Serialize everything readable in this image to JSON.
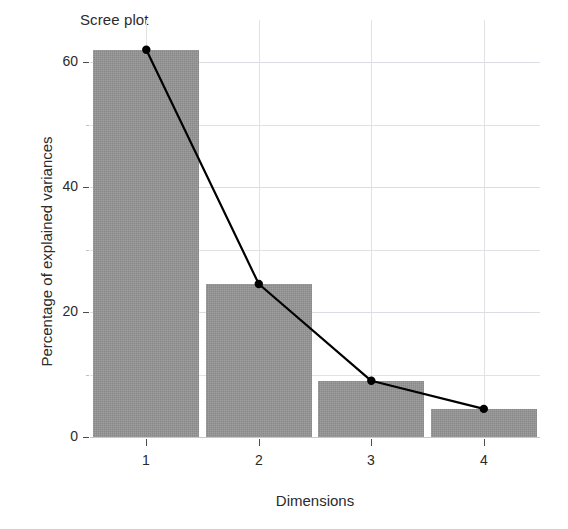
{
  "chart_data": {
    "type": "bar",
    "title": "Scree plot",
    "xlabel": "Dimensions",
    "ylabel": "Percentage of explained variances",
    "categories": [
      "1",
      "2",
      "3",
      "4"
    ],
    "values": [
      62.0,
      24.5,
      9.0,
      4.5
    ],
    "series": [
      {
        "name": "Percentage of explained variances",
        "type": "bar",
        "values": [
          62.0,
          24.5,
          9.0,
          4.5
        ]
      },
      {
        "name": "Cumulative trend line",
        "type": "line",
        "values": [
          62.0,
          24.5,
          9.0,
          4.5
        ],
        "marker": "filled-circle",
        "color": "#000000"
      }
    ],
    "ylim": [
      0,
      65
    ],
    "y_ticks": [
      0,
      20,
      40,
      60
    ],
    "y_tick_labels": [
      "0",
      "20",
      "40",
      "60"
    ],
    "y_minor_ticks": [
      10,
      30,
      50
    ],
    "x_ticks": [
      "1",
      "2",
      "3",
      "4"
    ],
    "grid": true,
    "legend": "none",
    "bar_color": "#969696",
    "line_color": "#000000",
    "grid_color": "#e2e2e6",
    "background": "#ffffff",
    "axis_text_color": "#2b2b2b"
  }
}
